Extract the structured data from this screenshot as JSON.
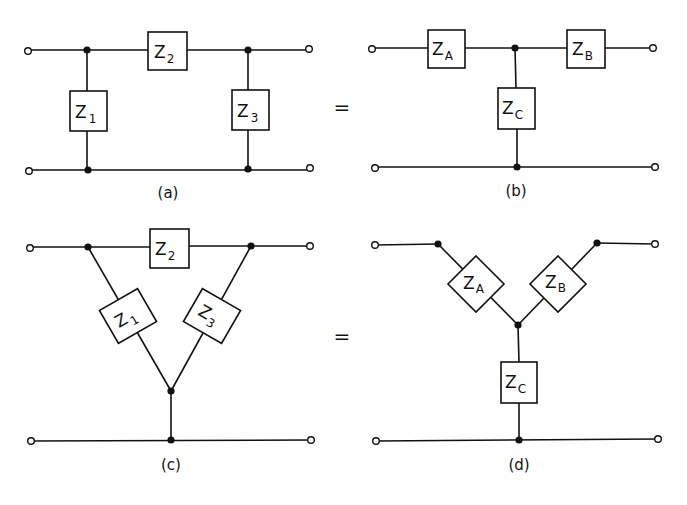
{
  "figure": {
    "panels": [
      {
        "id": "a",
        "caption": "(a)",
        "type": "pi-network",
        "impedances": [
          {
            "name": "Z",
            "sub": "1"
          },
          {
            "name": "Z",
            "sub": "2"
          },
          {
            "name": "Z",
            "sub": "3"
          }
        ]
      },
      {
        "id": "b",
        "caption": "(b)",
        "type": "T-network",
        "impedances": [
          {
            "name": "Z",
            "sub": "A"
          },
          {
            "name": "Z",
            "sub": "B"
          },
          {
            "name": "Z",
            "sub": "C"
          }
        ]
      },
      {
        "id": "c",
        "caption": "(c)",
        "type": "delta-network",
        "impedances": [
          {
            "name": "Z",
            "sub": "1"
          },
          {
            "name": "Z",
            "sub": "2"
          },
          {
            "name": "Z",
            "sub": "3"
          }
        ]
      },
      {
        "id": "d",
        "caption": "(d)",
        "type": "wye-network",
        "impedances": [
          {
            "name": "Z",
            "sub": "A"
          },
          {
            "name": "Z",
            "sub": "B"
          },
          {
            "name": "Z",
            "sub": "C"
          }
        ]
      }
    ],
    "equals_sign": "="
  }
}
